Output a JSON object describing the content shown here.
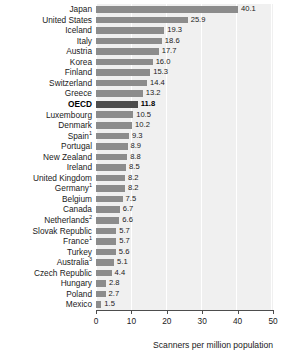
{
  "chart_data": {
    "type": "bar",
    "orientation": "horizontal",
    "title": "",
    "xlabel": "Scanners per million population",
    "ylabel": "",
    "xlim": [
      0,
      50
    ],
    "xticks": [
      0,
      10,
      20,
      30,
      40,
      50
    ],
    "xtick_labels": [
      "0",
      "10",
      "20",
      "30",
      "40",
      "50"
    ],
    "grid": true,
    "legend": null,
    "highlight_category": "OECD",
    "colors": {
      "bar": "#8c8c8c",
      "bar_highlight": "#4d4d4d",
      "plot_background": "#f0f0f0",
      "gridline": "#ffffff",
      "axis": "#4d4d4d",
      "text": "#1a1a1a"
    },
    "categories": [
      "Japan",
      "United States",
      "Iceland",
      "Italy",
      "Austria",
      "Korea",
      "Finland",
      "Switzerland",
      "Greece",
      "OECD",
      "Luxembourg",
      "Denmark",
      "Spain",
      "Portugal",
      "New Zealand",
      "Ireland",
      "United Kingdom",
      "Germany",
      "Belgium",
      "Canada",
      "Netherlands",
      "Slovak Republic",
      "France",
      "Turkey",
      "Australia",
      "Czech Republic",
      "Hungary",
      "Poland",
      "Mexico"
    ],
    "values": [
      40.1,
      25.9,
      19.3,
      18.6,
      17.7,
      16.0,
      15.3,
      14.4,
      13.2,
      11.8,
      10.5,
      10.2,
      9.3,
      8.9,
      8.8,
      8.5,
      8.2,
      8.2,
      7.5,
      6.7,
      6.6,
      5.7,
      5.7,
      5.6,
      5.1,
      4.4,
      2.8,
      2.7,
      1.5
    ],
    "value_labels": [
      "40.1",
      "25.9",
      "19.3",
      "18.6",
      "17.7",
      "16.0",
      "15.3",
      "14.4",
      "13.2",
      "11.8",
      "10.5",
      "10.2",
      "9.3",
      "8.9",
      "8.8",
      "8.5",
      "8.2",
      "8.2",
      "7.5",
      "6.7",
      "6.6",
      "5.7",
      "5.7",
      "5.6",
      "5.1",
      "4.4",
      "2.8",
      "2.7",
      "1.5"
    ],
    "footnote_markers": {
      "Spain": "1",
      "Germany": "1",
      "France": "1",
      "Netherlands": "2",
      "Australia": "3"
    }
  }
}
